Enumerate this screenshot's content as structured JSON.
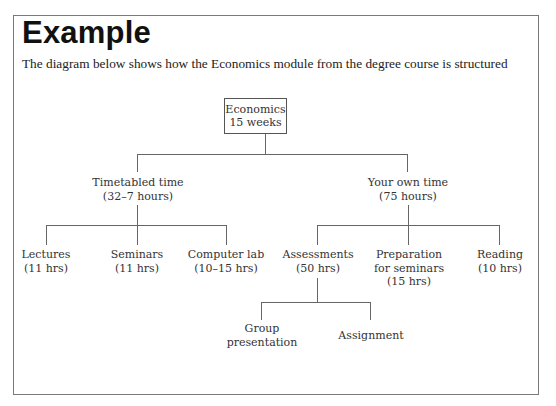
{
  "heading": "Example",
  "subtitle": "The diagram below shows how the Economics module from the degree course is structured",
  "diagram": {
    "root": {
      "title": "Economics",
      "detail": "15 weeks"
    },
    "branches": [
      {
        "title": "Timetabled time",
        "detail": "(32–7 hours)",
        "children": [
          {
            "lines": [
              "Lectures",
              "(11 hrs)"
            ]
          },
          {
            "lines": [
              "Seminars",
              "(11 hrs)"
            ]
          },
          {
            "lines": [
              "Computer lab",
              "(10–15 hrs)"
            ]
          }
        ]
      },
      {
        "title": "Your own time",
        "detail": "(75 hours)",
        "children": [
          {
            "lines": [
              "Assessments",
              "(50 hrs)"
            ],
            "children": [
              {
                "lines": [
                  "Group",
                  "presentation"
                ]
              },
              {
                "lines": [
                  "Assignment"
                ]
              }
            ]
          },
          {
            "lines": [
              "Preparation",
              "for seminars",
              "(15 hrs)"
            ]
          },
          {
            "lines": [
              "Reading",
              "(10 hrs)"
            ]
          }
        ]
      }
    ]
  }
}
